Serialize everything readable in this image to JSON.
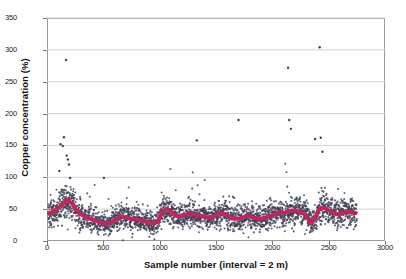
{
  "chart_data": {
    "type": "scatter",
    "title": "",
    "xlabel": "Sample number (interval = 2 m)",
    "ylabel": "Copper concentration (%)",
    "xlim": [
      0,
      3000
    ],
    "ylim": [
      0,
      350
    ],
    "xticks": [
      0,
      500,
      1000,
      1500,
      2000,
      2500,
      3000
    ],
    "yticks": [
      0,
      50,
      100,
      150,
      200,
      250,
      300,
      350
    ],
    "grid": "horizontal",
    "legend": "none",
    "marker_color": "#3d4257",
    "trend_color": "#c3245c",
    "series": [
      {
        "name": "Copper concentration",
        "type": "scatter",
        "n_points": 2750,
        "x_range": [
          10,
          2750
        ],
        "baseline_mean": 40,
        "description": "Dense cloud of sample assays, most between 10 and 80 percent, with scattered high outliers",
        "outliers": [
          {
            "x": 170,
            "y": 284
          },
          {
            "x": 150,
            "y": 163
          },
          {
            "x": 120,
            "y": 152
          },
          {
            "x": 140,
            "y": 149
          },
          {
            "x": 175,
            "y": 134
          },
          {
            "x": 185,
            "y": 128
          },
          {
            "x": 195,
            "y": 120
          },
          {
            "x": 110,
            "y": 110
          },
          {
            "x": 205,
            "y": 99
          },
          {
            "x": 505,
            "y": 99
          },
          {
            "x": 1330,
            "y": 158
          },
          {
            "x": 1700,
            "y": 190
          },
          {
            "x": 2140,
            "y": 272
          },
          {
            "x": 2150,
            "y": 190
          },
          {
            "x": 2165,
            "y": 176
          },
          {
            "x": 2380,
            "y": 160
          },
          {
            "x": 2420,
            "y": 304
          },
          {
            "x": 2430,
            "y": 162
          },
          {
            "x": 2445,
            "y": 140
          }
        ]
      },
      {
        "name": "Moving average",
        "type": "line",
        "color": "#c3245c",
        "width": 4,
        "x": [
          20,
          60,
          100,
          140,
          180,
          220,
          260,
          300,
          340,
          380,
          420,
          460,
          500,
          540,
          580,
          620,
          660,
          700,
          740,
          780,
          820,
          860,
          900,
          940,
          980,
          1020,
          1060,
          1100,
          1140,
          1180,
          1220,
          1260,
          1300,
          1340,
          1380,
          1420,
          1460,
          1500,
          1540,
          1580,
          1620,
          1660,
          1700,
          1740,
          1780,
          1820,
          1860,
          1900,
          1940,
          1980,
          2020,
          2060,
          2100,
          2140,
          2180,
          2220,
          2260,
          2300,
          2340,
          2380,
          2420,
          2460,
          2500,
          2540,
          2580,
          2620,
          2660,
          2700,
          2740
        ],
        "values": [
          43,
          47,
          52,
          58,
          64,
          60,
          48,
          42,
          38,
          35,
          33,
          30,
          28,
          27,
          30,
          35,
          38,
          37,
          35,
          34,
          33,
          31,
          29,
          28,
          30,
          45,
          50,
          46,
          40,
          38,
          41,
          43,
          42,
          40,
          39,
          37,
          36,
          41,
          44,
          42,
          38,
          36,
          35,
          37,
          40,
          38,
          36,
          35,
          37,
          39,
          42,
          45,
          44,
          46,
          48,
          47,
          45,
          40,
          28,
          36,
          50,
          52,
          48,
          44,
          42,
          44,
          46,
          45,
          44
        ]
      }
    ]
  },
  "axis": {
    "y_title": "Copper concentration (%)",
    "x_title": "Sample number (interval = 2 m)",
    "y_labels": [
      "350",
      "300",
      "250",
      "200",
      "150",
      "100",
      "50",
      "0"
    ],
    "x_labels": [
      "0",
      "500",
      "1000",
      "1500",
      "2000",
      "2500",
      "3000"
    ]
  }
}
